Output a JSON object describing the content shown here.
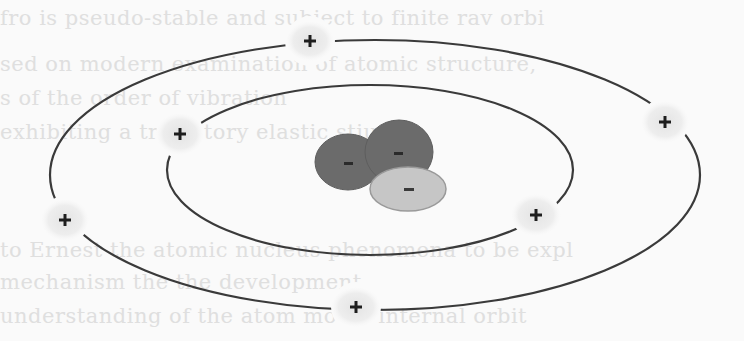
{
  "diagram": {
    "title": "",
    "type": "atomic model (planetary / Bohr-style)",
    "colors": {
      "background": "#fafafa",
      "orbit_line": "#3a3a3a",
      "proton_halo": "#e6e6e6",
      "proton_sign": "#1e1e1e",
      "nucleus_dark": "#6b6b6b",
      "nucleus_light": "#c6c6c6",
      "nucleus_sign": "#2a2a2a"
    },
    "orbits": [
      {
        "name": "outer-orbit",
        "cx": 375,
        "cy": 175,
        "rx": 325,
        "ry": 135
      },
      {
        "name": "inner-orbit",
        "cx": 370,
        "cy": 170,
        "rx": 203,
        "ry": 85
      }
    ],
    "particles_on_orbits": [
      {
        "name": "particle-top",
        "orbit": "outer",
        "x": 310,
        "y": 41,
        "sign": "+"
      },
      {
        "name": "particle-right-outer",
        "orbit": "outer",
        "x": 665,
        "y": 122,
        "sign": "+"
      },
      {
        "name": "particle-left-outer",
        "orbit": "outer",
        "x": 65,
        "y": 220,
        "sign": "+"
      },
      {
        "name": "particle-bottom",
        "orbit": "outer",
        "x": 356,
        "y": 307,
        "sign": "+"
      },
      {
        "name": "particle-left-inner",
        "orbit": "inner",
        "x": 180,
        "y": 134,
        "sign": "+"
      },
      {
        "name": "particle-right-inner",
        "orbit": "inner",
        "x": 536,
        "y": 215,
        "sign": "+"
      }
    ],
    "nucleus": [
      {
        "name": "nucleus-left-blob",
        "cx": 348,
        "cy": 162,
        "rx": 33,
        "ry": 28,
        "shade": "dark",
        "sign": "-"
      },
      {
        "name": "nucleus-right-blob",
        "cx": 399,
        "cy": 152,
        "rx": 34,
        "ry": 32,
        "shade": "dark",
        "sign": "-"
      },
      {
        "name": "nucleus-light-blob",
        "cx": 408,
        "cy": 189,
        "rx": 38,
        "ry": 22,
        "shade": "light",
        "sign": "-"
      }
    ]
  },
  "background_text": {
    "note": "faint bleed-through text from the page behind the figure",
    "lines": [
      {
        "y": 6,
        "x": 0,
        "text": "fro                                 is pseudo-stable and subject to         finite rav orbi"
      },
      {
        "y": 52,
        "x": 0,
        "text": "                                            sed on modern examination of atomic structure,"
      },
      {
        "y": 86,
        "x": 0,
        "text": "                                                s         of the order of         vibration"
      },
      {
        "y": 120,
        "x": 0,
        "text": "                                          exhibiting a trajectory                  elastic stiu"
      },
      {
        "y": 238,
        "x": 0,
        "text": "                                 to Ernest     the atomic nucleus            phenomena to be expl"
      },
      {
        "y": 270,
        "x": 0,
        "text": "                                 mechanism          the            the development"
      },
      {
        "y": 304,
        "x": 0,
        "text": "                                 understanding of the atom          model            internal orbit"
      }
    ]
  }
}
